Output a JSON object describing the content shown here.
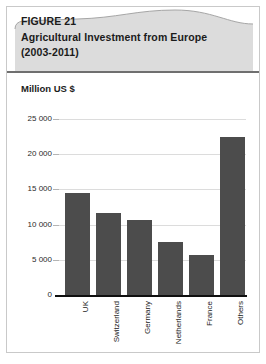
{
  "figure": {
    "label": "FIGURE 21",
    "title": "Agricultural Investment from Europe",
    "period": "(2003-2011)"
  },
  "chart_data": {
    "type": "bar",
    "title": "Agricultural Investment from Europe (2003-2011)",
    "unit_label": "Million US $",
    "xlabel": "",
    "ylabel": "Million US $",
    "categories": [
      "UK",
      "Switzerland",
      "Germany",
      "Netherlands",
      "France",
      "Others"
    ],
    "values": [
      14500,
      11700,
      10600,
      7500,
      5700,
      22400
    ],
    "ylim": [
      0,
      25000
    ],
    "yticks": [
      0,
      5000,
      10000,
      15000,
      20000,
      25000
    ],
    "ytick_labels": [
      "0",
      "5 000",
      "10 000",
      "15 000",
      "20 000",
      "25 000"
    ],
    "grid": true,
    "legend": "none",
    "bar_color": "#4c4c4c",
    "axis_color": "#101010",
    "grid_color": "#dcdcdc"
  }
}
